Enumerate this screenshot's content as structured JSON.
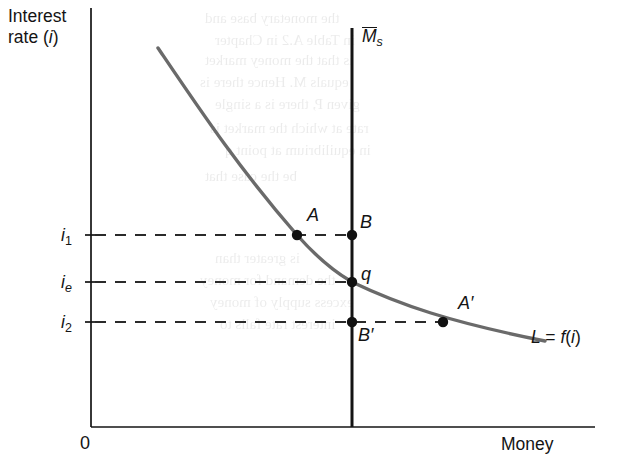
{
  "figure": {
    "type": "money-market-equilibrium-diagram",
    "background_color": "#ffffff",
    "curve_color": "#6a6a6a",
    "line_color": "#141414"
  },
  "axes": {
    "y_title_line1": "Interest",
    "y_title_line2_prefix": "rate (",
    "y_title_line2_var": "i",
    "y_title_line2_suffix": ")",
    "x_title": "Money",
    "origin_label": "0"
  },
  "y_ticks": [
    {
      "id": "i1",
      "var": "i",
      "sub": "1",
      "y": 235
    },
    {
      "id": "ie",
      "var": "i",
      "sub": "e",
      "y": 282
    },
    {
      "id": "i2",
      "var": "i",
      "sub": "2",
      "y": 322
    }
  ],
  "money_supply": {
    "label_var": "M",
    "label_sub": "s",
    "label_has_overbar": true,
    "x": 352
  },
  "demand_curve": {
    "label_prefix": "L",
    "label_equals": "=",
    "label_function": "f",
    "label_open": "(",
    "label_var": "i",
    "label_close": ")"
  },
  "points": [
    {
      "name": "A",
      "label": "A",
      "x": 297,
      "y": 235,
      "on": "demand-curve"
    },
    {
      "name": "B",
      "label": "B",
      "x": 352,
      "y": 235,
      "on": "money-supply"
    },
    {
      "name": "q",
      "label": "q",
      "x": 352,
      "y": 282,
      "on": "equilibrium"
    },
    {
      "name": "Bprime",
      "label": "B′",
      "x": 352,
      "y": 322,
      "on": "money-supply"
    },
    {
      "name": "Aprime",
      "label": "A′",
      "x": 443,
      "y": 322,
      "on": "demand-curve"
    }
  ],
  "dashed_lines": [
    {
      "id": "i1-line",
      "from_x": 91,
      "to_x": 352,
      "y": 235
    },
    {
      "id": "ie-line",
      "from_x": 91,
      "to_x": 352,
      "y": 282
    },
    {
      "id": "i2-line",
      "from_x": 91,
      "to_x": 443,
      "y": 322
    }
  ],
  "chart_data": {
    "type": "line",
    "title": "",
    "xlabel": "Money",
    "ylabel": "Interest rate (i)",
    "series": [
      {
        "name": "L = f(i)",
        "type": "curve",
        "description": "downward sloping convex money demand curve",
        "points": [
          [
            158,
            48
          ],
          [
            185,
            90
          ],
          [
            210,
            125
          ],
          [
            240,
            163
          ],
          [
            270,
            200
          ],
          [
            297,
            235
          ],
          [
            325,
            262
          ],
          [
            352,
            282
          ],
          [
            385,
            300
          ],
          [
            415,
            313
          ],
          [
            443,
            322
          ],
          [
            480,
            331
          ],
          [
            512,
            337
          ],
          [
            545,
            341
          ]
        ]
      },
      {
        "name": "Ms",
        "type": "vertical-line",
        "description": "fixed money supply (exogenous)",
        "x": 352,
        "y_from": 28,
        "y_to": 427
      }
    ],
    "axis_pixel_bounds": {
      "x_axis_y": 427,
      "y_axis_x": 91,
      "x_end": 595,
      "y_top": 8
    },
    "grid": false,
    "legend": "inline-labels"
  },
  "bleed_text": [
    {
      "text": "the monetary base and",
      "x": 205,
      "y": 10
    },
    {
      "text": "in Table A.2 in Chapter",
      "x": 215,
      "y": 32
    },
    {
      "text": "is that the money market",
      "x": 205,
      "y": 52
    },
    {
      "text": "equals M. Hence there is",
      "x": 200,
      "y": 74
    },
    {
      "text": "given P, there is a single",
      "x": 215,
      "y": 96
    },
    {
      "text": "rate at which the market is",
      "x": 210,
      "y": 120
    },
    {
      "text": "in equilibrium at point q",
      "x": 225,
      "y": 142
    },
    {
      "text": "be the case that",
      "x": 205,
      "y": 168
    },
    {
      "text": "is greater than",
      "x": 215,
      "y": 250
    },
    {
      "text": "the demand for money",
      "x": 200,
      "y": 272
    },
    {
      "text": "excess supply of money",
      "x": 210,
      "y": 294
    },
    {
      "text": "interest rate falls to",
      "x": 220,
      "y": 316
    }
  ]
}
